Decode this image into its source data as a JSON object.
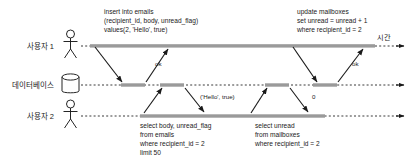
{
  "diagram": {
    "title_axis": "시간",
    "participants": [
      {
        "id": "user1",
        "label": "사용자 1",
        "icon": "actor-stick-figure",
        "y": 46
      },
      {
        "id": "database",
        "label": "데이터베이스",
        "icon": "database-cylinder",
        "y": 85
      },
      {
        "id": "user2",
        "label": "사용자 2",
        "icon": "actor-stick-figure",
        "y": 116
      }
    ],
    "notes": [
      {
        "id": "insert-note",
        "lines": [
          "insert into emails",
          "(recipient_id, body, unread_flag)",
          "values(2, 'Hello', true)"
        ]
      },
      {
        "id": "update-note",
        "lines": [
          "update mailboxes",
          "set unread = unread + 1",
          "where recipient_id = 2"
        ]
      },
      {
        "id": "select-emails-note",
        "lines": [
          "select body, unread_flag",
          "from emails",
          "where recipient_id = 2",
          "limit 50"
        ]
      },
      {
        "id": "select-mailboxes-note",
        "lines": [
          "select unread",
          "from mailboxes",
          "where recipient_id = 2"
        ]
      }
    ],
    "messages": [
      {
        "id": "insert-request",
        "label": "",
        "from": "user1",
        "to": "database"
      },
      {
        "id": "insert-response",
        "label": "ok",
        "from": "database",
        "to": "user1"
      },
      {
        "id": "select-emails-request",
        "label": "",
        "from": "user2",
        "to": "database"
      },
      {
        "id": "select-emails-response",
        "label": "('Hello', true)",
        "from": "database",
        "to": "user2"
      },
      {
        "id": "update-request",
        "label": "",
        "from": "user1",
        "to": "database"
      },
      {
        "id": "update-response",
        "label": "ok",
        "from": "database",
        "to": "user1"
      },
      {
        "id": "select-mailboxes-request",
        "label": "",
        "from": "user2",
        "to": "database"
      },
      {
        "id": "select-mailboxes-response",
        "label": "0",
        "from": "database",
        "to": "user2"
      }
    ],
    "colors": {
      "stroke": "#1a1a1a",
      "lifeline": "#3a3a3a",
      "activation": "#9a9a9a",
      "background": "#ffffff"
    }
  }
}
